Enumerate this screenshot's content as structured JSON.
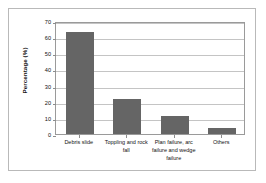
{
  "chart_data": {
    "type": "bar",
    "title": "",
    "xlabel": "",
    "ylabel": "Percentage (%)",
    "categories": [
      "Debris slide",
      "Toppling and rock fall",
      "Plan failure, arc failure and wedge failure",
      "Others"
    ],
    "values": [
      63,
      22,
      11,
      4
    ],
    "ylim": [
      0,
      70
    ],
    "yticks": [
      0,
      10,
      20,
      30,
      40,
      50,
      60,
      70
    ],
    "ytick_labels": [
      "0",
      "10",
      "20",
      "30",
      "40",
      "50",
      "60",
      "70"
    ],
    "grid": "horizontal",
    "legend": "none",
    "bar_color": "#656565",
    "gridline_color": "#c4c4c4",
    "axis_color": "#9a9a9a"
  }
}
